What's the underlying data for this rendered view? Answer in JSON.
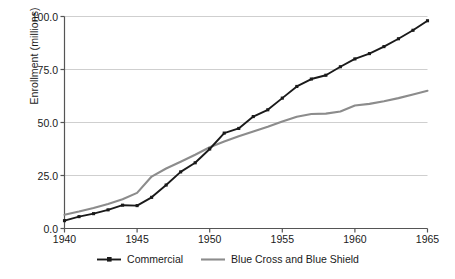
{
  "chart_data": {
    "type": "line",
    "title": "",
    "xlabel": "",
    "ylabel": "Enrollment (millions)",
    "xlim": [
      1940,
      1965
    ],
    "ylim": [
      0,
      100
    ],
    "grid": true,
    "grid_axis": "y",
    "legend_position": "bottom-center",
    "x": [
      1940,
      1941,
      1942,
      1943,
      1944,
      1945,
      1946,
      1947,
      1948,
      1949,
      1950,
      1951,
      1952,
      1953,
      1954,
      1955,
      1956,
      1957,
      1958,
      1959,
      1960,
      1961,
      1962,
      1963,
      1964,
      1965
    ],
    "xticks": [
      1940,
      1945,
      1950,
      1955,
      1960,
      1965
    ],
    "xtick_labels": [
      "1940",
      "1945",
      "1950",
      "1955",
      "1960",
      "1965"
    ],
    "yticks": [
      0,
      25,
      50,
      75,
      100
    ],
    "ytick_labels": [
      "0.0",
      "25.0",
      "50.0",
      "75.0",
      "100.0"
    ],
    "series": [
      {
        "name": "Commercial",
        "color": "#1a1a1a",
        "marker": "square",
        "has_markers": true,
        "line_width": 1.9,
        "values": [
          3.7,
          5.6,
          7.0,
          8.8,
          11.0,
          10.8,
          14.7,
          20.5,
          26.7,
          31.0,
          37.5,
          45.0,
          47.2,
          52.8,
          56.0,
          61.5,
          67.0,
          70.5,
          72.3,
          76.3,
          80.0,
          82.5,
          85.8,
          89.5,
          93.5,
          98.0
        ]
      },
      {
        "name": "Blue Cross and Blue Shield",
        "color": "#8c8c8c",
        "marker": "none",
        "has_markers": false,
        "line_width": 2.1,
        "values": [
          6.5,
          8.0,
          9.7,
          11.6,
          13.8,
          16.8,
          24.5,
          28.3,
          31.5,
          34.8,
          38.3,
          41.0,
          43.5,
          45.8,
          48.0,
          50.5,
          52.7,
          54.0,
          54.2,
          55.2,
          58.0,
          58.8,
          60.0,
          61.5,
          63.2,
          65.0
        ]
      }
    ]
  },
  "legend": {
    "items": [
      {
        "label": "Commercial",
        "color": "#1a1a1a",
        "marker": "square"
      },
      {
        "label": "Blue Cross and Blue Shield",
        "color": "#8c8c8c",
        "marker": "none"
      }
    ]
  },
  "colors": {
    "commercial": "#1a1a1a",
    "blue_cross": "#8c8c8c",
    "grid": "#cfcfcf",
    "axis": "#555555",
    "background": "#ffffff"
  }
}
